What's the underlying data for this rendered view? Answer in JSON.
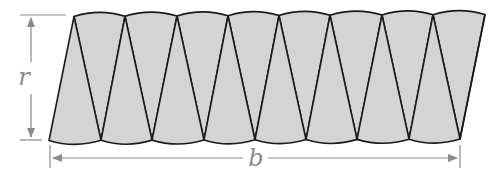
{
  "diagram": {
    "labels": {
      "height": "r",
      "base": "b"
    },
    "sector_count": 16,
    "colors": {
      "fill": "#d4d4d4",
      "stroke": "#1a1a1a",
      "dimension": "#8a8a8a",
      "background": "#ffffff"
    },
    "geometry": {
      "bottom_vertices_x": [
        49,
        101,
        152,
        204,
        255,
        306,
        357,
        409,
        460
      ],
      "top_vertices_x": [
        74,
        125,
        177,
        228,
        279,
        330,
        382,
        433,
        485
      ],
      "top_y": 15,
      "bottom_y": 140
    }
  }
}
